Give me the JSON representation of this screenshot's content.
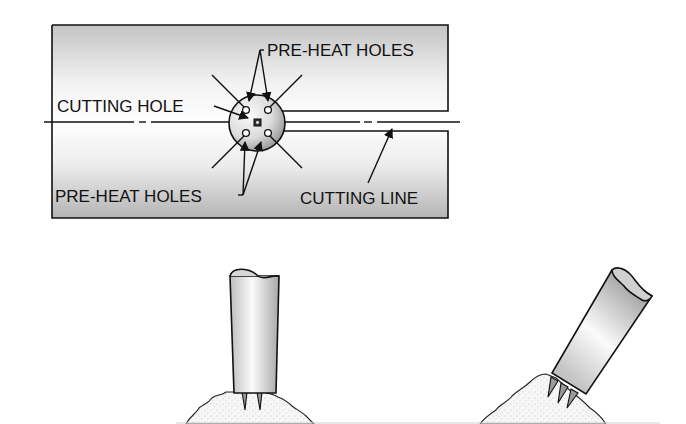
{
  "diagram": {
    "top_view": {
      "labels": {
        "preheat_top": "PRE-HEAT HOLES",
        "cutting_hole": "CUTTING HOLE",
        "preheat_bottom": "PRE-HEAT HOLES",
        "cutting_line": "CUTTING LINE"
      }
    },
    "torch_vertical": {
      "description": "torch tip held vertically over cut, two pre-heat flames"
    },
    "torch_angled": {
      "description": "torch tip angled over cut, three pre-heat flames"
    },
    "colors": {
      "line": "#111111",
      "plate_gradient_dark": "#b8b8b8",
      "plate_gradient_light": "#f4f4f4",
      "background": "#ffffff"
    }
  }
}
